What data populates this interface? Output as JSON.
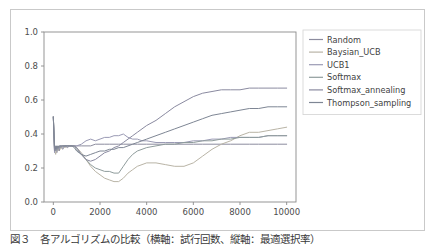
{
  "figure": {
    "background": "#ffffff",
    "border_color": "#c9c9c9",
    "axes_color": "#8a8a8a"
  },
  "caption": {
    "text": "図３　各アルゴリズムの比較（横軸：試行回数、縦軸：最適選択率）"
  },
  "chart_data": {
    "type": "line",
    "title": "",
    "xlabel": "",
    "ylabel": "",
    "xlim": [
      -400,
      10400
    ],
    "ylim": [
      0.0,
      1.0
    ],
    "grid": false,
    "legend_position": "right-outside",
    "xticks": [
      0,
      2000,
      4000,
      6000,
      8000,
      10000
    ],
    "xtick_labels": [
      "0",
      "2000",
      "4000",
      "6000",
      "8000",
      "10000"
    ],
    "yticks": [
      0.0,
      0.2,
      0.4,
      0.6,
      0.8,
      1.0
    ],
    "ytick_labels": [
      "0.0",
      "0.2",
      "0.4",
      "0.6",
      "0.8",
      "1.0"
    ],
    "x": [
      0,
      50,
      100,
      150,
      200,
      250,
      300,
      400,
      500,
      600,
      700,
      800,
      900,
      1000,
      1200,
      1400,
      1600,
      1800,
      2000,
      2200,
      2400,
      2600,
      2800,
      3000,
      3200,
      3400,
      3600,
      3800,
      4000,
      4400,
      4800,
      5200,
      5600,
      6000,
      6400,
      6800,
      7200,
      7600,
      8000,
      8400,
      8800,
      9200,
      9600,
      10000
    ],
    "series": [
      {
        "name": "Random",
        "color": "#8c8c9e",
        "values": [
          0.5,
          0.3,
          0.33,
          0.29,
          0.32,
          0.3,
          0.33,
          0.31,
          0.33,
          0.32,
          0.33,
          0.33,
          0.33,
          0.33,
          0.33,
          0.33,
          0.33,
          0.34,
          0.34,
          0.34,
          0.34,
          0.34,
          0.34,
          0.34,
          0.34,
          0.34,
          0.34,
          0.34,
          0.34,
          0.34,
          0.34,
          0.34,
          0.34,
          0.34,
          0.34,
          0.34,
          0.34,
          0.34,
          0.34,
          0.34,
          0.34,
          0.34,
          0.34,
          0.34
        ]
      },
      {
        "name": "Baysian_UCB",
        "color": "#b9b4a6",
        "values": [
          0.5,
          0.31,
          0.28,
          0.32,
          0.3,
          0.33,
          0.31,
          0.33,
          0.32,
          0.33,
          0.33,
          0.33,
          0.33,
          0.32,
          0.29,
          0.25,
          0.21,
          0.18,
          0.16,
          0.14,
          0.13,
          0.12,
          0.12,
          0.14,
          0.17,
          0.19,
          0.21,
          0.22,
          0.23,
          0.23,
          0.22,
          0.21,
          0.21,
          0.23,
          0.27,
          0.31,
          0.34,
          0.36,
          0.39,
          0.41,
          0.41,
          0.42,
          0.43,
          0.44
        ]
      },
      {
        "name": "UCB1",
        "color": "#9a9ab4",
        "values": [
          0.5,
          0.29,
          0.32,
          0.3,
          0.33,
          0.31,
          0.33,
          0.32,
          0.33,
          0.33,
          0.33,
          0.33,
          0.33,
          0.33,
          0.34,
          0.36,
          0.37,
          0.36,
          0.37,
          0.38,
          0.38,
          0.39,
          0.39,
          0.4,
          0.38,
          0.37,
          0.37,
          0.36,
          0.36,
          0.35,
          0.35,
          0.35,
          0.35,
          0.36,
          0.36,
          0.37,
          0.37,
          0.38,
          0.38,
          0.38,
          0.38,
          0.39,
          0.39,
          0.39
        ]
      },
      {
        "name": "Softmax",
        "color": "#8f9c9c",
        "values": [
          0.5,
          0.32,
          0.3,
          0.33,
          0.31,
          0.33,
          0.32,
          0.33,
          0.33,
          0.33,
          0.33,
          0.33,
          0.33,
          0.31,
          0.28,
          0.25,
          0.22,
          0.2,
          0.19,
          0.18,
          0.18,
          0.17,
          0.17,
          0.21,
          0.25,
          0.28,
          0.3,
          0.31,
          0.32,
          0.33,
          0.34,
          0.34,
          0.35,
          0.35,
          0.36,
          0.36,
          0.37,
          0.37,
          0.38,
          0.38,
          0.38,
          0.39,
          0.39,
          0.39
        ]
      },
      {
        "name": "Softmax_annealing",
        "color": "#8a8aa0",
        "values": [
          0.5,
          0.3,
          0.33,
          0.31,
          0.33,
          0.32,
          0.33,
          0.33,
          0.33,
          0.33,
          0.33,
          0.33,
          0.33,
          0.32,
          0.28,
          0.25,
          0.24,
          0.25,
          0.27,
          0.29,
          0.3,
          0.32,
          0.33,
          0.35,
          0.37,
          0.39,
          0.41,
          0.43,
          0.45,
          0.48,
          0.52,
          0.56,
          0.59,
          0.62,
          0.64,
          0.65,
          0.66,
          0.66,
          0.66,
          0.67,
          0.67,
          0.67,
          0.67,
          0.67
        ]
      },
      {
        "name": "Thompson_sampling",
        "color": "#7e8694",
        "values": [
          0.5,
          0.33,
          0.31,
          0.33,
          0.32,
          0.33,
          0.33,
          0.33,
          0.33,
          0.33,
          0.33,
          0.33,
          0.32,
          0.3,
          0.28,
          0.27,
          0.28,
          0.29,
          0.3,
          0.3,
          0.31,
          0.31,
          0.32,
          0.32,
          0.33,
          0.34,
          0.35,
          0.36,
          0.37,
          0.39,
          0.41,
          0.43,
          0.45,
          0.47,
          0.49,
          0.51,
          0.52,
          0.53,
          0.54,
          0.55,
          0.55,
          0.56,
          0.56,
          0.56
        ]
      }
    ]
  }
}
